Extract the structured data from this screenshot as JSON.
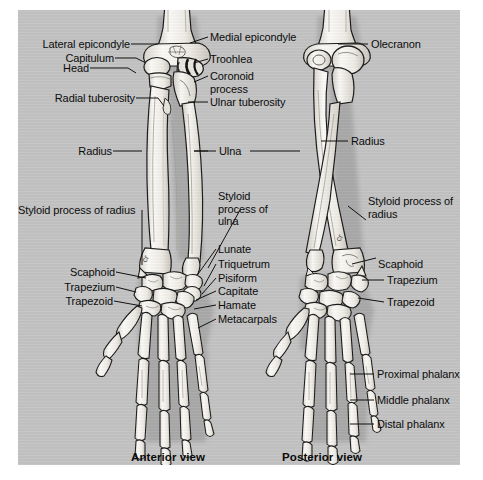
{
  "figure": {
    "background_color": "#c3c3c3",
    "page_color": "#ffffff",
    "ink_color": "#111111",
    "bone_fill": "#f2f0ec",
    "captions": {
      "anterior": "Anterior view",
      "posterior": "Posterior view"
    }
  },
  "labels": {
    "left_column": [
      {
        "id": "lateral-epicondyle",
        "text": "Lateral epicondyle"
      },
      {
        "id": "capitulum",
        "text": "Capitulum"
      },
      {
        "id": "head",
        "text": "Head"
      },
      {
        "id": "radial-tuberosity",
        "text": "Radial tuberosity"
      },
      {
        "id": "radius-left",
        "text": "Radius"
      },
      {
        "id": "styloid-process-of-radius-left",
        "text": "Styloid process of radius"
      },
      {
        "id": "scaphoid-left",
        "text": "Scaphoid"
      },
      {
        "id": "trapezium-left",
        "text": "Trapezium"
      },
      {
        "id": "trapezoid-left",
        "text": "Trapezoid"
      }
    ],
    "center_column": [
      {
        "id": "medial-epicondyle",
        "text": "Medial epicondyle"
      },
      {
        "id": "trochlea",
        "text": "Troohlea"
      },
      {
        "id": "coronoid-process",
        "text": "Coronoid process"
      },
      {
        "id": "ulnar-tuberosity",
        "text": "Ulnar tuberosity"
      },
      {
        "id": "ulna",
        "text": "Ulna"
      },
      {
        "id": "styloid-process-of-ulna",
        "text": "Styloid process of ulna"
      },
      {
        "id": "lunate",
        "text": "Lunate"
      },
      {
        "id": "triquetrum",
        "text": "Triquetrum"
      },
      {
        "id": "pisiform",
        "text": "Pisiform"
      },
      {
        "id": "capitate",
        "text": "Capitate"
      },
      {
        "id": "hamate",
        "text": "Hamate"
      },
      {
        "id": "metacarpals",
        "text": "Metacarpals"
      }
    ],
    "right_column": [
      {
        "id": "olecranon",
        "text": "Olecranon"
      },
      {
        "id": "radius-right",
        "text": "Radius"
      },
      {
        "id": "styloid-process-of-radius-right",
        "text": "Styloid process of radius"
      },
      {
        "id": "scaphoid-right",
        "text": "Scaphoid"
      },
      {
        "id": "trapezium-right",
        "text": "Trapezium"
      },
      {
        "id": "trapezoid-right",
        "text": "Trapezoid"
      },
      {
        "id": "proximal-phalanx",
        "text": "Proximal phalanx"
      },
      {
        "id": "middle-phalanx",
        "text": "Middle phalanx"
      },
      {
        "id": "distal-phalanx",
        "text": "Distal phalanx"
      }
    ]
  }
}
